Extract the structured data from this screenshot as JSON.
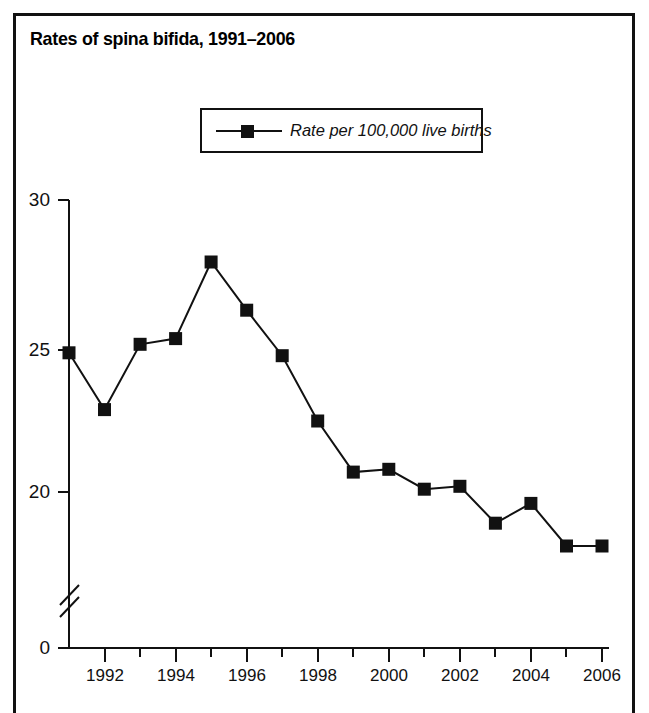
{
  "title": "Rates of spina bifida, 1991–2006",
  "legend": {
    "label": "Rate per 100,000 live births",
    "marker": "filled-square-marker"
  },
  "axis": {
    "y_ticks": [
      "30",
      "25",
      "20",
      "0"
    ],
    "y_break": "axis-break-symbol",
    "x_ticks": [
      "1992",
      "1994",
      "1996",
      "1998",
      "2000",
      "2002",
      "2004",
      "2006"
    ]
  },
  "colors": {
    "line": "#111111",
    "marker": "#111111",
    "frame": "#111111",
    "background": "#ffffff"
  },
  "chart_data": {
    "type": "line",
    "title": "Rates of spina bifida, 1991–2006",
    "xlabel": "",
    "ylabel": "",
    "x": [
      1991,
      1992,
      1993,
      1994,
      1995,
      1996,
      1997,
      1998,
      1999,
      2000,
      2001,
      2002,
      2003,
      2004,
      2005,
      2006
    ],
    "series": [
      {
        "name": "Rate per 100,000 live births",
        "values": [
          24.9,
          22.9,
          25.2,
          25.4,
          28.1,
          26.4,
          24.8,
          22.5,
          20.7,
          20.8,
          20.1,
          20.2,
          18.9,
          19.6,
          18.1,
          18.1
        ]
      }
    ],
    "ylim": [
      18.5,
      30
    ],
    "y_axis_break": true,
    "y_tick_values": [
      30,
      25,
      20,
      0
    ],
    "x_tick_values": [
      1992,
      1994,
      1996,
      1998,
      2000,
      2002,
      2004,
      2006
    ],
    "grid": false,
    "legend_position": "top-center",
    "marker": "square"
  }
}
